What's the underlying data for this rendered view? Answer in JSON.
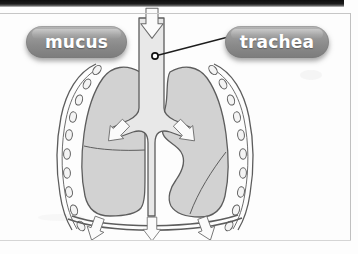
{
  "figure": {
    "kind": "anatomical-diagram",
    "labels": [
      {
        "id": "mucus",
        "text": "mucus",
        "style": "grey-rounded-pill",
        "x": 26,
        "y": 26
      },
      {
        "id": "trachea",
        "text": "trachea",
        "style": "grey-rounded-pill",
        "x": 225,
        "y": 26
      }
    ],
    "leader_lines": [
      {
        "from": "trachea",
        "to_point": "trachea-tube",
        "marker": "filled-dot"
      }
    ],
    "airflow_arrows": [
      {
        "id": "trachea-inflow",
        "direction": "down",
        "location": "top of trachea"
      },
      {
        "id": "bronchus-left",
        "direction": "down-left",
        "location": "left main bronchus"
      },
      {
        "id": "bronchus-right",
        "direction": "down-right",
        "location": "right main bronchus"
      },
      {
        "id": "diaphragm-left",
        "direction": "down",
        "location": "below diaphragm, left"
      },
      {
        "id": "diaphragm-center",
        "direction": "down",
        "location": "below diaphragm, centre"
      },
      {
        "id": "diaphragm-right",
        "direction": "down",
        "location": "below diaphragm, right"
      }
    ],
    "parts": [
      {
        "id": "trachea-tube",
        "name": "trachea"
      },
      {
        "id": "bronchi",
        "name": "bronchi"
      },
      {
        "id": "lung-left",
        "name": "left lung"
      },
      {
        "id": "lung-right",
        "name": "right lung"
      },
      {
        "id": "lobe-fissure",
        "name": "lobe fissure line"
      },
      {
        "id": "rib-cage",
        "name": "rib cage outline"
      },
      {
        "id": "mucus-beads",
        "name": "mucus beads chain",
        "count_left": 9,
        "count_right": 9
      },
      {
        "id": "diaphragm",
        "name": "diaphragm"
      }
    ]
  },
  "colors": {
    "page_background": "#fdfdfd",
    "scan_band": "#141414",
    "page_border": "#c6c6c6",
    "lung_fill": "#d2d2d2",
    "lung_fill_dark": "#c3c3c3",
    "airway_fill": "#e8e8e8",
    "outline": "#5d5d5d",
    "arrow_fill": "#fbfbfb",
    "arrow_outline": "#6a6a6a",
    "pill_top": "#b9b9b9",
    "pill_bottom": "#7c7c7c",
    "pill_text": "#ffffff",
    "leader_line": "#1d1d1d"
  }
}
